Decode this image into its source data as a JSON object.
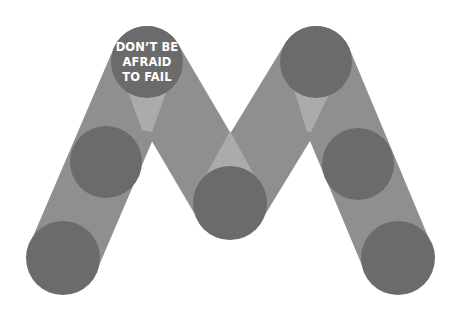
{
  "graphic": {
    "type": "M-shaped logo of overlapping bands and circles",
    "slogan": {
      "lines": [
        "DON’T BE",
        "AFRAID",
        "TO FAIL"
      ]
    },
    "colors": {
      "background": "#ffffff",
      "band": "#8f8f8f",
      "overlap": "#ababab",
      "circle": "#6b6b6b",
      "text": "#ffffff"
    },
    "circles": [
      {
        "name": "top-left",
        "cx": 147,
        "cy": 62,
        "r": 36
      },
      {
        "name": "left-middle",
        "cx": 106,
        "cy": 162,
        "r": 36
      },
      {
        "name": "bottom-left",
        "cx": 63,
        "cy": 258,
        "r": 37
      },
      {
        "name": "center-bottom",
        "cx": 230,
        "cy": 203,
        "r": 37
      },
      {
        "name": "top-right",
        "cx": 316,
        "cy": 62,
        "r": 36
      },
      {
        "name": "right-middle",
        "cx": 358,
        "cy": 164,
        "r": 36
      },
      {
        "name": "bottom-right",
        "cx": 398,
        "cy": 258,
        "r": 37
      }
    ]
  }
}
